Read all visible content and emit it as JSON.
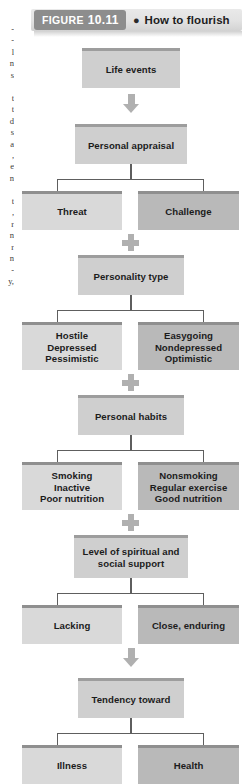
{
  "figure": {
    "tag_label": "FIGURE",
    "tag_number": "10.11",
    "bullet": "●",
    "title": "How to flourish"
  },
  "gutter": {
    "fragment": "-\n-\nl\nn\ns\n\nt\nt\nd\ns\na\n,\ne\nn\n\nt\n,\nr\nn\nr\nn\n-\ny,"
  },
  "icons": {
    "arrow": "down-arrow-icon",
    "plus": "plus-connector-icon",
    "bullet": "bullet-dot-icon"
  },
  "flow": {
    "nodes": [
      {
        "id": "life-events",
        "tone": "center",
        "text": "Life events"
      },
      {
        "id": "personal-appraisal",
        "tone": "center",
        "text": "Personal appraisal"
      },
      {
        "id": "threat",
        "tone": "light",
        "text": "Threat"
      },
      {
        "id": "challenge",
        "tone": "dark",
        "text": "Challenge"
      },
      {
        "id": "personality-type",
        "tone": "center",
        "text": "Personality type"
      },
      {
        "id": "hostile",
        "tone": "light",
        "lines": [
          "Hostile",
          "Depressed",
          "Pessimistic"
        ]
      },
      {
        "id": "easygoing",
        "tone": "dark",
        "lines": [
          "Easygoing",
          "Nondepressed",
          "Optimistic"
        ]
      },
      {
        "id": "personal-habits",
        "tone": "center",
        "text": "Personal habits"
      },
      {
        "id": "smoking",
        "tone": "light",
        "lines": [
          "Smoking",
          "Inactive",
          "Poor nutrition"
        ]
      },
      {
        "id": "nonsmoking",
        "tone": "dark",
        "lines": [
          "Nonsmoking",
          "Regular exercise",
          "Good nutrition"
        ]
      },
      {
        "id": "support-level",
        "tone": "center",
        "lines": [
          "Level of spiritual and",
          "social support"
        ]
      },
      {
        "id": "lacking",
        "tone": "light",
        "text": "Lacking"
      },
      {
        "id": "close-enduring",
        "tone": "dark",
        "text": "Close, enduring"
      },
      {
        "id": "tendency-toward",
        "tone": "center",
        "text": "Tendency toward"
      },
      {
        "id": "illness",
        "tone": "light",
        "text": "Illness"
      },
      {
        "id": "health",
        "tone": "dark",
        "text": "Health"
      }
    ]
  }
}
